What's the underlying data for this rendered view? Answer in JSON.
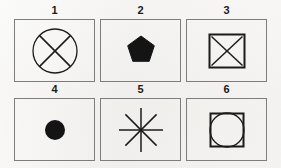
{
  "figure": {
    "background_color": "#f2f1ef",
    "ink_color": "#1b1b1b",
    "frame_color": "#7d7d7d",
    "panels": [
      {
        "label": "1",
        "shape_name": "circle-with-diagonal-cross",
        "description": "Outlined circle with an X (two diagonal lines) inscribed",
        "filled": false
      },
      {
        "label": "2",
        "shape_name": "filled-pentagon",
        "description": "Solid black regular pentagon, apex pointing up",
        "filled": true
      },
      {
        "label": "3",
        "shape_name": "square-with-diagonal-cross",
        "description": "Outlined square with an X (two diagonal lines) inscribed",
        "filled": false
      },
      {
        "label": "4",
        "shape_name": "filled-circle",
        "description": "Solid black circle (dot)",
        "filled": true
      },
      {
        "label": "5",
        "shape_name": "eight-ray-asterisk",
        "description": "Eight-pointed asterisk formed by four crossing lines",
        "filled": false
      },
      {
        "label": "6",
        "shape_name": "square-with-inscribed-circle",
        "description": "Outlined square with a circle inscribed touching its edges",
        "filled": false
      }
    ]
  }
}
